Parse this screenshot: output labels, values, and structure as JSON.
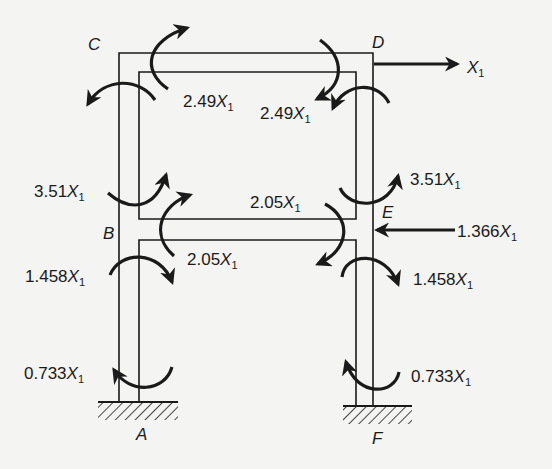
{
  "diagram": {
    "type": "two-storey portal frame free-body / moment diagram",
    "colors": {
      "ink": "#1a1a1a",
      "background": "#f4f4f2"
    },
    "nodes": {
      "A": "A",
      "B": "B",
      "C": "C",
      "D": "D",
      "E": "E",
      "F": "F"
    },
    "supports": [
      {
        "id": "A",
        "type": "fixed",
        "label": "A"
      },
      {
        "id": "F",
        "type": "fixed",
        "label": "F"
      }
    ],
    "loads": [
      {
        "at": "D",
        "direction": "right",
        "coef": "",
        "var": "X",
        "sub": "1"
      },
      {
        "at": "E",
        "direction": "left",
        "coef": "1.366",
        "var": "X",
        "sub": "1"
      }
    ],
    "moments": [
      {
        "at": "C-beam",
        "coef": "2.49",
        "var": "X",
        "sub": "1"
      },
      {
        "at": "D-beam",
        "coef": "2.49",
        "var": "X",
        "sub": "1"
      },
      {
        "at": "B-upper-column",
        "coef": "3.51",
        "var": "X",
        "sub": "1"
      },
      {
        "at": "E-upper-column",
        "coef": "3.51",
        "var": "X",
        "sub": "1"
      },
      {
        "at": "E-beam",
        "coef": "2.05",
        "var": "X",
        "sub": "1"
      },
      {
        "at": "B-beam",
        "coef": "2.05",
        "var": "X",
        "sub": "1"
      },
      {
        "at": "B-lower-column",
        "coef": "1.458",
        "var": "X",
        "sub": "1"
      },
      {
        "at": "E-lower-column",
        "coef": "1.458",
        "var": "X",
        "sub": "1"
      },
      {
        "at": "A-base",
        "coef": "0.733",
        "var": "X",
        "sub": "1"
      },
      {
        "at": "F-base",
        "coef": "0.733",
        "var": "X",
        "sub": "1"
      }
    ]
  }
}
